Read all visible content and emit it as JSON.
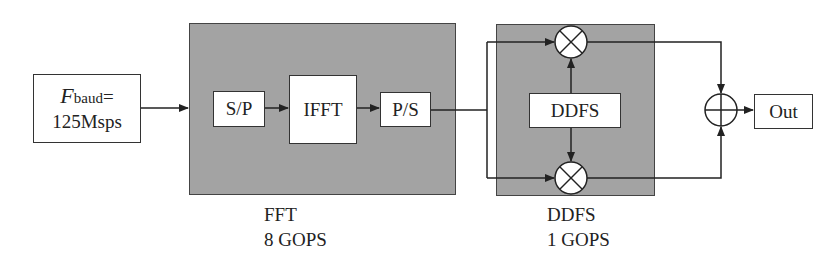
{
  "input": {
    "symbol": "F",
    "subscript": "baud",
    "suffix": "=",
    "value": "125Msps"
  },
  "fft_block": {
    "stages": [
      "S/P",
      "IFFT",
      "P/S"
    ],
    "caption_name": "FFT",
    "caption_ops": "8 GOPS"
  },
  "ddfs_block": {
    "inner_label": "DDFS",
    "caption_name": "DDFS",
    "caption_ops": "1 GOPS",
    "mixer_symbol": "×"
  },
  "adder_symbol": "+",
  "output": {
    "label": "Out"
  },
  "colors": {
    "block_fill": "#a3a3a3",
    "line": "#222222"
  }
}
